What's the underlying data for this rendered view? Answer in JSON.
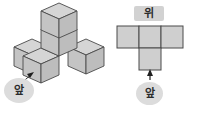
{
  "figure": {
    "background_color": "#ffffff",
    "cube_top_face_color": "#d5d5d5",
    "cube_left_face_color": "#c4c4c4",
    "cube_right_face_color": "#bdbdbd",
    "cube_edge_color": "#4a4a4a",
    "label_fill_color": "#dcdcdc",
    "label_text_color": "#2b2b2b",
    "arrow_color": "#1f1f1f"
  },
  "left_diagram": {
    "name": "isometric-cube-solid",
    "cube_count": 5,
    "front_label": "앞",
    "front_label_meaning": "front",
    "arrow": "arrow pointing up-right from label to the front cube"
  },
  "right_diagram": {
    "name": "top-view-grid",
    "top_label": "위",
    "top_label_meaning": "top",
    "front_label": "앞",
    "front_label_meaning": "front",
    "arrow": "arrow pointing up from front label to the grid",
    "grid": {
      "rows": 2,
      "cols": 3,
      "filled_cells": [
        [
          0,
          0
        ],
        [
          0,
          1
        ],
        [
          0,
          2
        ],
        [
          1,
          1
        ]
      ],
      "shape": "T-shape: three squares in the top row, one square below the center",
      "square_count": 4,
      "cell_fill_color": "#cfcfcf",
      "cell_stroke_color": "#4a4a4a"
    }
  }
}
